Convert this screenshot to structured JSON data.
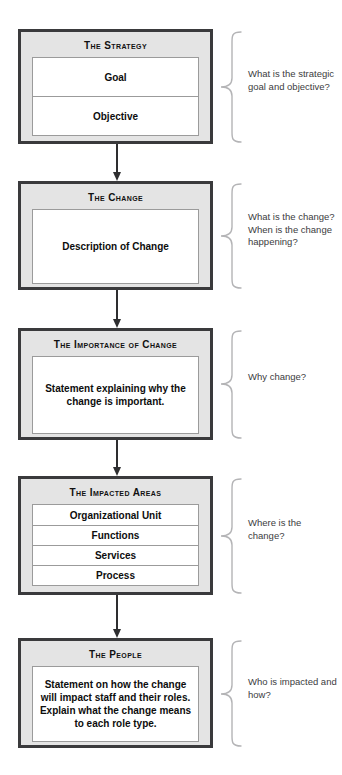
{
  "diagram": {
    "type": "vertical-flowchart",
    "colors": {
      "box_border": "#3a3a3c",
      "box_fill": "#e4e4e4",
      "panel_fill": "#ffffff",
      "panel_border": "#9b9b9b",
      "arrow": "#2e2e30",
      "brace": "#b4b4b6",
      "annotation_text": "#3c3c3e",
      "title_text": "#111111"
    },
    "stages": [
      {
        "id": "strategy",
        "title": "The Strategy",
        "rows": [
          "Goal",
          "Objective"
        ],
        "annotation": "What is the strategic goal and objective?"
      },
      {
        "id": "change",
        "title": "The Change",
        "rows": [
          "Description of Change"
        ],
        "annotation": "What is the change? When is the change happening?"
      },
      {
        "id": "importance-of-change",
        "title": "The Importance of Change",
        "rows": [
          "Statement explaining why the change is important."
        ],
        "annotation": "Why change?"
      },
      {
        "id": "impacted-areas",
        "title": "The Impacted Areas",
        "rows": [
          "Organizational Unit",
          "Functions",
          "Services",
          "Process"
        ],
        "annotation": "Where is the change?"
      },
      {
        "id": "people",
        "title": "The People",
        "rows": [
          "Statement on how the change will impact staff and their roles. Explain what the change means to each role type."
        ],
        "annotation": "Who is impacted and how?"
      }
    ]
  }
}
